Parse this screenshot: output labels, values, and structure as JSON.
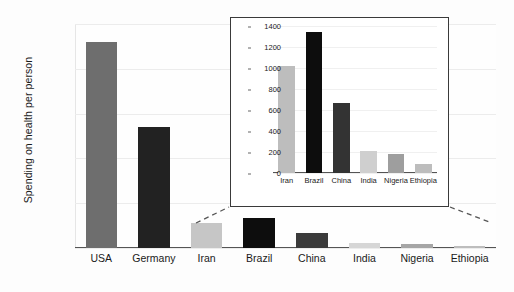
{
  "chart_data": [
    {
      "id": "main",
      "type": "bar",
      "title": "",
      "xlabel": "",
      "ylabel": "Spending on health per person",
      "ylim": [
        0,
        10000
      ],
      "yticks": [
        0,
        2000,
        4000,
        6000,
        8000,
        10000
      ],
      "ytick_labels": [
        "0",
        "2000",
        "4000",
        "6000",
        "8000",
        "10000"
      ],
      "grid": true,
      "legend": "none",
      "categories": [
        "USA",
        "Germany",
        "Iran",
        "Brazil",
        "China",
        "India",
        "Nigeria",
        "Ethiopia"
      ],
      "values": [
        9200,
        5400,
        1100,
        1350,
        680,
        210,
        190,
        90
      ],
      "bar_colors": [
        "#6e6e6e",
        "#222222",
        "#c6c6c6",
        "#0d0d0d",
        "#3b3b3b",
        "#d6d6d6",
        "#a6a6a6",
        "#bdbdbd"
      ]
    },
    {
      "id": "inset",
      "type": "bar",
      "title": "",
      "xlabel": "",
      "ylabel": "",
      "ylim": [
        0,
        1400
      ],
      "yticks": [
        0,
        200,
        400,
        600,
        800,
        1000,
        1200,
        1400
      ],
      "ytick_labels": [
        "0",
        "200",
        "400",
        "600",
        "800",
        "1000",
        "1200",
        "1400"
      ],
      "grid": true,
      "legend": "none",
      "categories": [
        "Iran",
        "Brazil",
        "China",
        "India",
        "Nigeria",
        "Ethiopia"
      ],
      "values": [
        1020,
        1340,
        670,
        210,
        185,
        90
      ],
      "bar_colors": [
        "#bdbdbd",
        "#0d0d0d",
        "#333333",
        "#cfcfcf",
        "#9e9e9e",
        "#bdbdbd"
      ]
    }
  ],
  "main": {
    "y_axis_title": "Spending on health per person"
  },
  "inset": {
    "connector_note": "dashed leader lines linking inset frame to small bars in main chart"
  }
}
